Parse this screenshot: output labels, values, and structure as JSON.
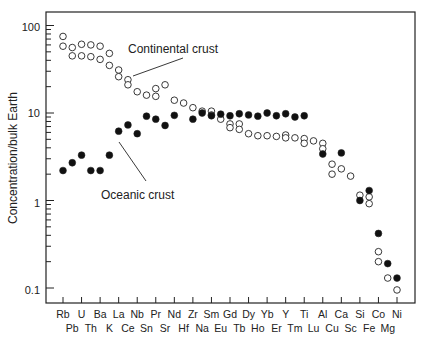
{
  "chart_data": {
    "type": "scatter",
    "title": "",
    "xlabel": "",
    "ylabel": "Concentration/bulk Earth",
    "yscale": "log",
    "ylim": [
      0.08,
      130
    ],
    "yticks": [
      0.1,
      1,
      10,
      100
    ],
    "ytick_labels": [
      "0.1",
      "1",
      "10",
      "100"
    ],
    "grid": false,
    "legend": null,
    "x_categories": [
      "Rb",
      "Pb",
      "U",
      "Th",
      "Ba",
      "K",
      "La",
      "Ce",
      "Nb",
      "Sn",
      "Pr",
      "Sr",
      "Nd",
      "Hf",
      "Zr",
      "Na",
      "Sm",
      "Eu",
      "Gd",
      "Tb",
      "Dy",
      "Ho",
      "Yb",
      "Er",
      "Y",
      "Tm",
      "Ti",
      "Lu",
      "Al",
      "Cu",
      "Ca",
      "Sc",
      "Si",
      "Fe",
      "Co",
      "Mg",
      "Ni"
    ],
    "x_labels_top": [
      "Rb",
      "U",
      "Ba",
      "La",
      "Nb",
      "Pr",
      "Nd",
      "Zr",
      "Sm",
      "Gd",
      "Dy",
      "Yb",
      "Y",
      "Ti",
      "Al",
      "Ca",
      "Si",
      "Co",
      "Ni"
    ],
    "x_labels_bottom": [
      "Pb",
      "Th",
      "K",
      "Ce",
      "Sn",
      "Sr",
      "Hf",
      "Na",
      "Eu",
      "Tb",
      "Ho",
      "Er",
      "Tm",
      "Lu",
      "Cu",
      "Sc",
      "Fe",
      "Mg"
    ],
    "series": [
      {
        "name": "Continental crust",
        "marker": "open-circle",
        "points": [
          {
            "x": "Rb",
            "y": 75
          },
          {
            "x": "Rb",
            "y": 58
          },
          {
            "x": "Pb",
            "y": 56
          },
          {
            "x": "Pb",
            "y": 45
          },
          {
            "x": "U",
            "y": 61
          },
          {
            "x": "U",
            "y": 45
          },
          {
            "x": "Th",
            "y": 60
          },
          {
            "x": "Th",
            "y": 44
          },
          {
            "x": "Ba",
            "y": 58
          },
          {
            "x": "Ba",
            "y": 41
          },
          {
            "x": "K",
            "y": 48
          },
          {
            "x": "K",
            "y": 35
          },
          {
            "x": "La",
            "y": 31
          },
          {
            "x": "La",
            "y": 26
          },
          {
            "x": "Ce",
            "y": 24
          },
          {
            "x": "Ce",
            "y": 21
          },
          {
            "x": "Nb",
            "y": 17.5
          },
          {
            "x": "Sn",
            "y": 16
          },
          {
            "x": "Pr",
            "y": 19
          },
          {
            "x": "Pr",
            "y": 15.5
          },
          {
            "x": "Sr",
            "y": 21
          },
          {
            "x": "Nd",
            "y": 14
          },
          {
            "x": "Hf",
            "y": 13
          },
          {
            "x": "Zr",
            "y": 11.5
          },
          {
            "x": "Na",
            "y": 10.5
          },
          {
            "x": "Sm",
            "y": 10.5
          },
          {
            "x": "Sm",
            "y": 9.5
          },
          {
            "x": "Eu",
            "y": 8.5
          },
          {
            "x": "Gd",
            "y": 7.5
          },
          {
            "x": "Gd",
            "y": 6.8
          },
          {
            "x": "Tb",
            "y": 7.5
          },
          {
            "x": "Tb",
            "y": 6.5
          },
          {
            "x": "Dy",
            "y": 5.8
          },
          {
            "x": "Ho",
            "y": 5.5
          },
          {
            "x": "Yb",
            "y": 5.5
          },
          {
            "x": "Er",
            "y": 5.4
          },
          {
            "x": "Y",
            "y": 5.6
          },
          {
            "x": "Y",
            "y": 5.2
          },
          {
            "x": "Tm",
            "y": 5.2
          },
          {
            "x": "Ti",
            "y": 5.1
          },
          {
            "x": "Ti",
            "y": 4.5
          },
          {
            "x": "Lu",
            "y": 4.8
          },
          {
            "x": "Al",
            "y": 4.5
          },
          {
            "x": "Al",
            "y": 3.9
          },
          {
            "x": "Cu",
            "y": 2.6
          },
          {
            "x": "Cu",
            "y": 2.0
          },
          {
            "x": "Ca",
            "y": 2.3
          },
          {
            "x": "Sc",
            "y": 1.9
          },
          {
            "x": "Si",
            "y": 1.15
          },
          {
            "x": "Fe",
            "y": 1.1
          },
          {
            "x": "Fe",
            "y": 0.92
          },
          {
            "x": "Co",
            "y": 0.26
          },
          {
            "x": "Co",
            "y": 0.2
          },
          {
            "x": "Mg",
            "y": 0.13
          },
          {
            "x": "Ni",
            "y": 0.095
          }
        ]
      },
      {
        "name": "Oceanic crust",
        "marker": "filled-circle",
        "points": [
          {
            "x": "Rb",
            "y": 2.2
          },
          {
            "x": "Pb",
            "y": 2.7
          },
          {
            "x": "U",
            "y": 3.3
          },
          {
            "x": "Th",
            "y": 2.2
          },
          {
            "x": "Ba",
            "y": 2.2
          },
          {
            "x": "K",
            "y": 3.3
          },
          {
            "x": "La",
            "y": 6.2
          },
          {
            "x": "Ce",
            "y": 7.3
          },
          {
            "x": "Nb",
            "y": 5.8
          },
          {
            "x": "Sn",
            "y": 9.2
          },
          {
            "x": "Pr",
            "y": 8.5
          },
          {
            "x": "Sr",
            "y": 7.2
          },
          {
            "x": "Nd",
            "y": 9.4
          },
          {
            "x": "Zr",
            "y": 8.5
          },
          {
            "x": "Na",
            "y": 10
          },
          {
            "x": "Sm",
            "y": 9.3
          },
          {
            "x": "Eu",
            "y": 9.7
          },
          {
            "x": "Gd",
            "y": 9.3
          },
          {
            "x": "Tb",
            "y": 9.8
          },
          {
            "x": "Dy",
            "y": 9.5
          },
          {
            "x": "Ho",
            "y": 9.2
          },
          {
            "x": "Yb",
            "y": 10
          },
          {
            "x": "Er",
            "y": 9.3
          },
          {
            "x": "Y",
            "y": 9.8
          },
          {
            "x": "Tm",
            "y": 9.0
          },
          {
            "x": "Ti",
            "y": 9.3
          },
          {
            "x": "Al",
            "y": 3.4
          },
          {
            "x": "Ca",
            "y": 3.5
          },
          {
            "x": "Si",
            "y": 1.0
          },
          {
            "x": "Fe",
            "y": 1.3
          },
          {
            "x": "Co",
            "y": 0.42
          },
          {
            "x": "Mg",
            "y": 0.19
          },
          {
            "x": "Ni",
            "y": 0.13
          }
        ]
      }
    ],
    "annotations": [
      {
        "text": "Continental crust",
        "target_series": "Continental crust"
      },
      {
        "text": "Oceanic crust",
        "target_series": "Oceanic crust"
      }
    ]
  },
  "labels": {
    "ylabel": "Concentration/bulk Earth",
    "annot_continental": "Continental crust",
    "annot_oceanic": "Oceanic crust",
    "ytick_100": "100",
    "ytick_10": "10",
    "ytick_1": "1",
    "ytick_01": "0.1"
  }
}
